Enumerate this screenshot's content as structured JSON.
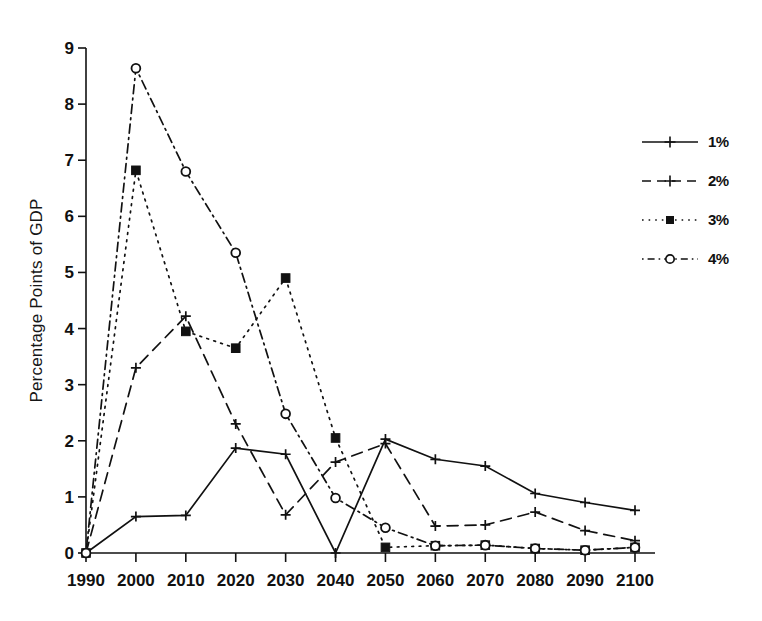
{
  "chart_data": {
    "type": "line",
    "title": "",
    "subtitle": "",
    "xlabel": "",
    "ylabel": "Percentage Points of GDP",
    "x": [
      1990,
      2000,
      2010,
      2020,
      2030,
      2040,
      2050,
      2060,
      2070,
      2080,
      2090,
      2100
    ],
    "xtick_labels": [
      "1990",
      "2000",
      "2010",
      "2020",
      "2030",
      "2040",
      "2050",
      "2060",
      "2070",
      "2080",
      "2090",
      "2100"
    ],
    "ytick_labels": [
      "0",
      "1",
      "2",
      "3",
      "4",
      "5",
      "6",
      "7",
      "8",
      "9"
    ],
    "ylim": [
      0,
      9
    ],
    "xlim": [
      1990,
      2100
    ],
    "grid": false,
    "legend_position": "right",
    "series": [
      {
        "name": "1%",
        "marker": "plus",
        "linestyle": "solid",
        "color": "#111111",
        "values": [
          0.0,
          0.65,
          0.67,
          1.87,
          1.76,
          0.0,
          2.03,
          1.67,
          1.55,
          1.06,
          0.9,
          0.76
        ]
      },
      {
        "name": "2%",
        "marker": "plus",
        "linestyle": "dashed",
        "color": "#111111",
        "values": [
          0.0,
          3.3,
          4.22,
          2.3,
          0.68,
          1.62,
          1.95,
          0.48,
          0.5,
          0.73,
          0.4,
          0.22
        ]
      },
      {
        "name": "3%",
        "marker": "filled-square",
        "linestyle": "dotted",
        "color": "#111111",
        "values": [
          0.0,
          6.82,
          3.95,
          3.65,
          4.9,
          2.05,
          0.1,
          0.13,
          0.14,
          0.08,
          0.05,
          0.1
        ]
      },
      {
        "name": "4%",
        "marker": "open-circle",
        "linestyle": "dashdot",
        "color": "#111111",
        "values": [
          0.0,
          8.64,
          6.8,
          5.35,
          2.48,
          0.98,
          0.45,
          0.13,
          0.14,
          0.08,
          0.05,
          0.1
        ]
      }
    ]
  },
  "legend": {
    "items": [
      {
        "label": "1%"
      },
      {
        "label": "2%"
      },
      {
        "label": "3%"
      },
      {
        "label": "4%"
      }
    ]
  },
  "axes": {
    "y_title": "Percentage Points of GDP"
  }
}
